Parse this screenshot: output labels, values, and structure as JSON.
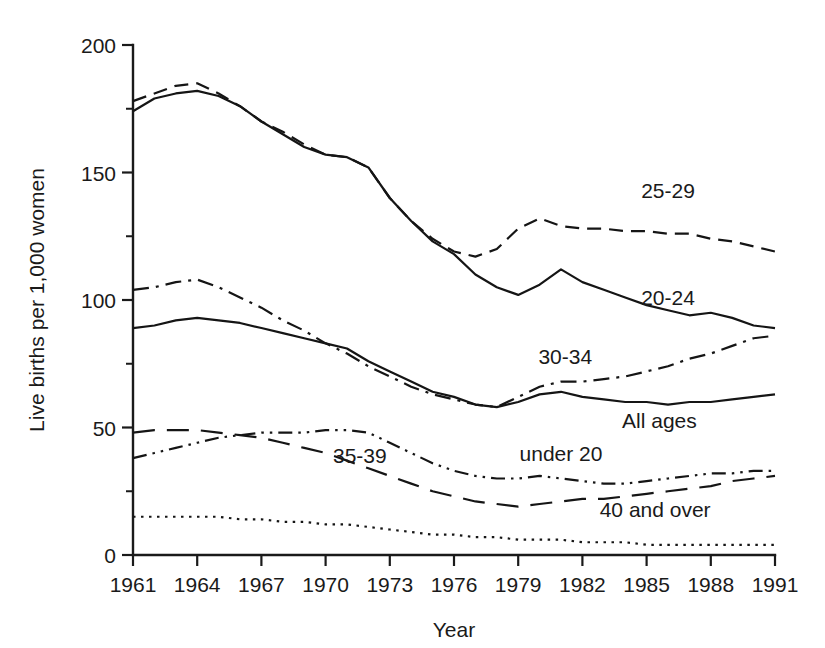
{
  "chart_data": {
    "type": "line",
    "title": "",
    "xlabel": "Year",
    "ylabel": "Live births per 1,000 women",
    "xlim": [
      1961,
      1991
    ],
    "ylim": [
      0,
      200
    ],
    "grid": false,
    "legend_position": "inline-labels",
    "x_ticks": [
      "1961",
      "1964",
      "1967",
      "1970",
      "1973",
      "1976",
      "1979",
      "1982",
      "1985",
      "1988",
      "1991"
    ],
    "x_tick_values": [
      1961,
      1964,
      1967,
      1970,
      1973,
      1976,
      1979,
      1982,
      1985,
      1988,
      1991
    ],
    "y_ticks": [
      "0",
      "50",
      "100",
      "150",
      "200"
    ],
    "y_tick_values": [
      0,
      50,
      100,
      150,
      200
    ],
    "y_minor_tick_values": [
      25,
      75,
      125,
      175
    ],
    "x": [
      1961,
      1962,
      1963,
      1964,
      1965,
      1966,
      1967,
      1968,
      1969,
      1970,
      1971,
      1972,
      1973,
      1974,
      1975,
      1976,
      1977,
      1978,
      1979,
      1980,
      1981,
      1982,
      1983,
      1984,
      1985,
      1986,
      1987,
      1988,
      1989,
      1990,
      1991
    ],
    "series": [
      {
        "name": "25-29",
        "label": "25-29",
        "style": "dashed",
        "values": [
          178,
          181,
          184,
          185,
          181,
          176,
          170,
          166,
          161,
          157,
          156,
          152,
          140,
          131,
          124,
          119,
          117,
          120,
          128,
          132,
          129,
          128,
          128,
          127,
          127,
          126,
          126,
          124,
          123,
          121,
          119
        ]
      },
      {
        "name": "20-24",
        "label": "20-24",
        "style": "solid",
        "values": [
          174,
          179,
          181,
          182,
          180,
          176,
          170,
          165,
          160,
          157,
          156,
          152,
          140,
          131,
          123,
          118,
          110,
          105,
          102,
          106,
          112,
          107,
          104,
          101,
          98,
          96,
          94,
          95,
          93,
          90,
          89
        ]
      },
      {
        "name": "30-34",
        "label": "30-34",
        "style": "dashdot",
        "values": [
          104,
          105,
          107,
          108,
          105,
          101,
          97,
          92,
          88,
          83,
          79,
          74,
          70,
          66,
          63,
          61,
          59,
          58,
          62,
          66,
          68,
          68,
          69,
          70,
          72,
          74,
          77,
          79,
          82,
          85,
          86
        ]
      },
      {
        "name": "All ages",
        "label": "All ages",
        "style": "solid",
        "values": [
          89,
          90,
          92,
          93,
          92,
          91,
          89,
          87,
          85,
          83,
          81,
          76,
          72,
          68,
          64,
          62,
          59,
          58,
          60,
          63,
          64,
          62,
          61,
          60,
          60,
          59,
          60,
          60,
          61,
          62,
          63
        ]
      },
      {
        "name": "35-39",
        "label": "35-39",
        "style": "longdash",
        "values": [
          48,
          49,
          49,
          49,
          48,
          47,
          46,
          44,
          42,
          40,
          37,
          34,
          31,
          28,
          25,
          23,
          21,
          20,
          19,
          20,
          21,
          22,
          22,
          23,
          24,
          25,
          26,
          27,
          29,
          30,
          31
        ]
      },
      {
        "name": "under 20",
        "label": "under 20",
        "style": "dashdotdot",
        "values": [
          38,
          40,
          42,
          44,
          46,
          47,
          48,
          48,
          48,
          49,
          49,
          48,
          44,
          40,
          36,
          33,
          31,
          30,
          30,
          31,
          30,
          29,
          28,
          28,
          29,
          30,
          31,
          32,
          32,
          33,
          33
        ]
      },
      {
        "name": "40 and over",
        "label": "40 and over",
        "style": "dotted",
        "values": [
          15,
          15,
          15,
          15,
          15,
          14,
          14,
          13,
          13,
          12,
          12,
          11,
          10,
          9,
          8,
          8,
          7,
          7,
          6,
          6,
          6,
          5,
          5,
          5,
          4,
          4,
          4,
          4,
          4,
          4,
          4
        ]
      }
    ],
    "annotations": [
      {
        "text": "25-29",
        "x": 1986.0,
        "y": 140
      },
      {
        "text": "20-24",
        "x": 1986.0,
        "y": 98
      },
      {
        "text": "30-34",
        "x": 1981.2,
        "y": 75
      },
      {
        "text": "All ages",
        "x": 1985.6,
        "y": 50
      },
      {
        "text": "35-39",
        "x": 1971.6,
        "y": 36
      },
      {
        "text": "under 20",
        "x": 1981.0,
        "y": 37
      },
      {
        "text": "40 and over",
        "x": 1985.4,
        "y": 15
      }
    ]
  },
  "colors": {
    "line": "#151515",
    "axis": "#1a1a1a",
    "background": "#ffffff"
  }
}
